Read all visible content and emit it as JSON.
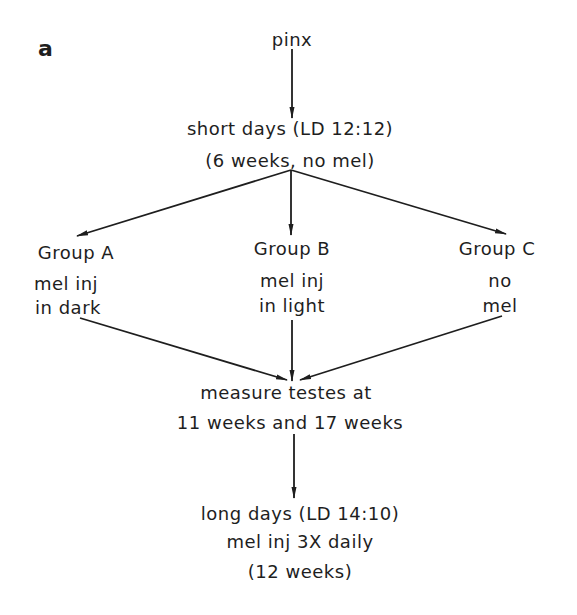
{
  "panel_label": "a",
  "nodes": {
    "start": {
      "text": "pinx"
    },
    "short_days": {
      "line1": "short days (LD 12:12)",
      "line2": "(6 weeks, no mel)"
    },
    "group_a": {
      "title": "Group A",
      "line1": "mel inj",
      "line2": "in dark"
    },
    "group_b": {
      "title": "Group B",
      "line1": "mel inj",
      "line2": "in light"
    },
    "group_c": {
      "title": "Group C",
      "line1": "no",
      "line2": "mel"
    },
    "measure": {
      "line1": "measure testes at",
      "line2": "11 weeks and 17 weeks"
    },
    "long_days": {
      "line1": "long days (LD 14:10)",
      "line2": "mel inj 3X daily",
      "line3": "(12 weeks)"
    }
  },
  "edges": [
    {
      "from": "pinx",
      "to": "short days"
    },
    {
      "from": "short days",
      "to": "Group A"
    },
    {
      "from": "short days",
      "to": "Group B"
    },
    {
      "from": "short days",
      "to": "Group C"
    },
    {
      "from": "Group A",
      "to": "measure testes"
    },
    {
      "from": "Group B",
      "to": "measure testes"
    },
    {
      "from": "Group C",
      "to": "measure testes"
    },
    {
      "from": "measure testes",
      "to": "long days"
    }
  ]
}
